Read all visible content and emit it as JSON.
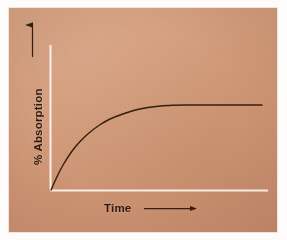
{
  "figure": {
    "kind": "hand-drawn-line-graph",
    "medium_label": "tan-paper-card",
    "background_color": "#d39a78",
    "card_border_color": "#ffffff",
    "ink_color": "#32200f",
    "axis_line_color": "#f7efe6"
  },
  "axes": {
    "y": {
      "label": "% Absorption",
      "arrow_icon": "up-arrow-icon",
      "arrow_direction": "up",
      "line_color": "#f7efe6",
      "label_rotation_deg": -90
    },
    "x": {
      "label": "Time",
      "arrow_icon": "right-arrow-icon",
      "arrow_direction": "right",
      "line_color": "#f7efe6"
    }
  },
  "chart_data": {
    "type": "line",
    "title": "",
    "subtitle": "",
    "xlabel": "Time",
    "ylabel": "% Absorption",
    "xlim": [
      0,
      100
    ],
    "ylim": [
      0,
      100
    ],
    "grid": false,
    "legend": null,
    "axis_ticks": {
      "x": [],
      "y": []
    },
    "annotations": [],
    "series": [
      {
        "name": "% Absorption vs Time",
        "color": "#32200f",
        "shape": "saturating-exponential-rise-to-plateau",
        "plateau_value": 85,
        "x": [
          0,
          3,
          6,
          10,
          14,
          18,
          23,
          28,
          34,
          40,
          46,
          52,
          58,
          64,
          70,
          76,
          82,
          88,
          94,
          100
        ],
        "values": [
          0,
          14,
          26,
          39,
          49,
          57,
          65,
          71,
          76,
          80,
          82.5,
          84,
          84.7,
          85,
          85,
          85,
          85,
          85,
          85,
          85
        ]
      }
    ]
  }
}
